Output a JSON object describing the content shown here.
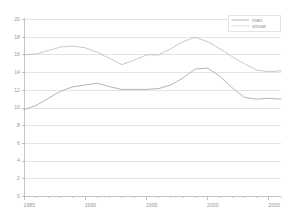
{
  "chart_data": {
    "type": "line",
    "title": "",
    "subtitle": "",
    "xlabel": "",
    "ylabel": "",
    "xlim": [
      1985,
      2006
    ],
    "ylim": [
      0,
      20
    ],
    "grid": true,
    "grid_axis": "y",
    "legend_position": "top-right",
    "x": [
      1985,
      1986,
      1987,
      1988,
      1989,
      1990,
      1991,
      1992,
      1993,
      1994,
      1995,
      1996,
      1997,
      1998,
      1999,
      2000,
      2001,
      2002,
      2003,
      2004,
      2005,
      2006
    ],
    "series": [
      {
        "name": "man",
        "style": "solid",
        "color": "#b0b0b0",
        "values": [
          9.8,
          10.3,
          11.1,
          11.9,
          12.4,
          12.6,
          12.8,
          12.4,
          12.1,
          12.1,
          12.1,
          12.2,
          12.6,
          13.4,
          14.4,
          14.5,
          13.6,
          12.3,
          11.2,
          11.0,
          11.1,
          11.0
        ]
      },
      {
        "name": "vrouw",
        "style": "dotted",
        "color": "#b8b8b8",
        "values": [
          16.0,
          16.1,
          16.5,
          16.9,
          17.0,
          16.8,
          16.3,
          15.6,
          14.9,
          15.4,
          16.0,
          16.0,
          16.7,
          17.5,
          18.0,
          17.5,
          16.7,
          15.8,
          15.0,
          14.3,
          14.1,
          14.2
        ]
      }
    ],
    "yticks": [
      0,
      2,
      4,
      6,
      8,
      10,
      12,
      14,
      16,
      18,
      20
    ],
    "ytick_labels": [
      "0",
      "2",
      "4",
      "6",
      "8",
      "10",
      "12",
      "14",
      "16",
      "18",
      "20"
    ],
    "xticks": [
      1985,
      1990,
      1995,
      2000,
      2005
    ],
    "xtick_labels": [
      "1985",
      "1990",
      "1995",
      "2000",
      "2005"
    ],
    "xminor_ticks": [
      1986,
      1987,
      1988,
      1989,
      1991,
      1992,
      1993,
      1994,
      1996,
      1997,
      1998,
      1999,
      2001,
      2002,
      2003,
      2004,
      2006
    ],
    "legend": [
      {
        "label": "man",
        "style": "solid"
      },
      {
        "label": "vrouw",
        "style": "dotted"
      }
    ],
    "colors": {
      "axis": "#b5b5b5",
      "grid": "#d9d9d9",
      "tick_text": "#9a9a9a",
      "legend_text": "#8f8f8f",
      "legend_border": "#d0d0d0",
      "background": "#ffffff"
    }
  }
}
